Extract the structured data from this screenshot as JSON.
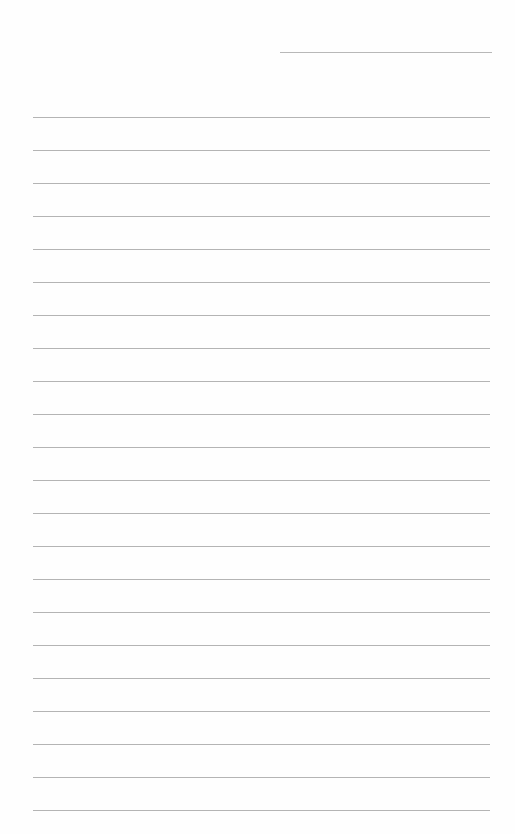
{
  "page": {
    "type": "blank lined notebook paper",
    "background_color": "#fefefe",
    "line_color": "#b4b4b4",
    "header_line": {
      "present": true
    },
    "ruled_lines_count": 22,
    "text_content": ""
  }
}
